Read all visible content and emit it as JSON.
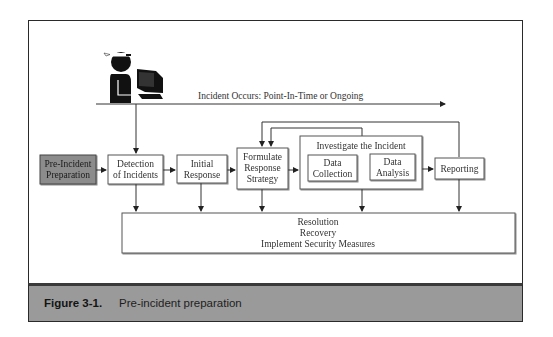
{
  "figure": {
    "label": "Figure 3-1.",
    "caption": "Pre-incident preparation"
  },
  "timeline": {
    "label": "Incident Occurs: Point-In-Time or Ongoing",
    "icon": "hacker-at-computer-icon"
  },
  "nodes": {
    "pre_incident": {
      "lines": [
        "Pre-Incident",
        "Preparation"
      ],
      "highlighted": true
    },
    "detection": {
      "lines": [
        "Detection",
        "of Incidents"
      ]
    },
    "initial_response": {
      "lines": [
        "Initial",
        "Response"
      ]
    },
    "formulate": {
      "lines": [
        "Formulate",
        "Response",
        "Strategy"
      ]
    },
    "investigate": {
      "title": "Investigate the Incident",
      "data_collection": {
        "lines": [
          "Data",
          "Collection"
        ]
      },
      "data_analysis": {
        "lines": [
          "Data",
          "Analysis"
        ]
      }
    },
    "reporting": {
      "lines": [
        "Reporting"
      ]
    },
    "resolution": {
      "lines": [
        "Resolution",
        "Recovery",
        "Implement Security Measures"
      ]
    }
  },
  "edges": [
    {
      "from": "timeline",
      "to": "detection"
    },
    {
      "from": "pre_incident",
      "to": "detection"
    },
    {
      "from": "detection",
      "to": "initial_response"
    },
    {
      "from": "initial_response",
      "to": "formulate"
    },
    {
      "from": "formulate",
      "to": "investigate"
    },
    {
      "from": "investigate",
      "to": "reporting"
    },
    {
      "from": "investigate",
      "to": "formulate",
      "type": "feedback"
    },
    {
      "from": "reporting",
      "to": "formulate",
      "type": "feedback"
    },
    {
      "from": "detection",
      "to": "resolution"
    },
    {
      "from": "initial_response",
      "to": "resolution"
    },
    {
      "from": "formulate",
      "to": "resolution"
    },
    {
      "from": "investigate",
      "to": "resolution"
    },
    {
      "from": "reporting",
      "to": "resolution"
    }
  ],
  "colors": {
    "highlight_fill": "#8c8c8c",
    "box_stroke": "#555555",
    "caption_bg": "#9a9a9a"
  }
}
